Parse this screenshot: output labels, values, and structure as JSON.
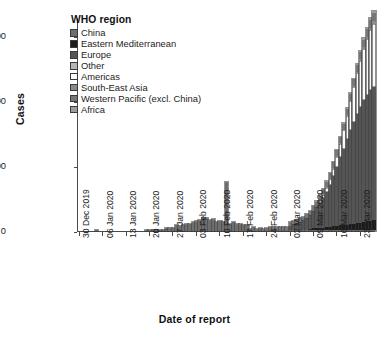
{
  "chart_data": {
    "type": "bar",
    "stacked": true,
    "title": "",
    "xlabel": "Date of report",
    "ylabel": "Cases",
    "ylim": [
      0,
      66000
    ],
    "yticks": [
      0,
      20000,
      40000,
      60000
    ],
    "ytick_labels": [
      "0",
      "20000",
      "40000",
      "60000"
    ],
    "grid": false,
    "legend_title": "WHO region",
    "legend_position": "top-left-inside",
    "xtick_labels": [
      "30 Dec 2019",
      "06 Jan 2020",
      "13 Jan 2020",
      "20 Jan 2020",
      "27 Jan 2020",
      "03 Feb 2020",
      "10 Feb 2020",
      "17 Feb 2020",
      "24 Feb 2020",
      "02 Mar 2020",
      "09 Mar 2020",
      "16 Mar 2020",
      "23 Mar 2020"
    ],
    "xtick_indices": [
      0,
      7,
      14,
      21,
      28,
      35,
      42,
      49,
      56,
      63,
      70,
      77,
      84
    ],
    "series": [
      {
        "name": "China",
        "color": "#6e6e6e"
      },
      {
        "name": "Eastern Mediterranean",
        "color": "#1c1c1c"
      },
      {
        "name": "Europe",
        "color": "#555555"
      },
      {
        "name": "Other",
        "color": "#b5b5b5"
      },
      {
        "name": "Americas",
        "color": "#fbfbfb"
      },
      {
        "name": "South-East Asia",
        "color": "#8a8a8a"
      },
      {
        "name": "Western Pacific (excl. China)",
        "color": "#777777"
      },
      {
        "name": "Africa",
        "color": "#9d9d9d"
      }
    ],
    "x": [
      "2019-12-30",
      "2019-12-31",
      "2020-01-01",
      "2020-01-02",
      "2020-01-03",
      "2020-01-04",
      "2020-01-05",
      "2020-01-06",
      "2020-01-07",
      "2020-01-08",
      "2020-01-09",
      "2020-01-10",
      "2020-01-11",
      "2020-01-12",
      "2020-01-13",
      "2020-01-14",
      "2020-01-15",
      "2020-01-16",
      "2020-01-17",
      "2020-01-18",
      "2020-01-19",
      "2020-01-20",
      "2020-01-21",
      "2020-01-22",
      "2020-01-23",
      "2020-01-24",
      "2020-01-25",
      "2020-01-26",
      "2020-01-27",
      "2020-01-28",
      "2020-01-29",
      "2020-01-30",
      "2020-01-31",
      "2020-02-01",
      "2020-02-02",
      "2020-02-03",
      "2020-02-04",
      "2020-02-05",
      "2020-02-06",
      "2020-02-07",
      "2020-02-08",
      "2020-02-09",
      "2020-02-10",
      "2020-02-11",
      "2020-02-12",
      "2020-02-13",
      "2020-02-14",
      "2020-02-15",
      "2020-02-16",
      "2020-02-17",
      "2020-02-18",
      "2020-02-19",
      "2020-02-20",
      "2020-02-21",
      "2020-02-22",
      "2020-02-23",
      "2020-02-24",
      "2020-02-25",
      "2020-02-26",
      "2020-02-27",
      "2020-02-28",
      "2020-02-29",
      "2020-03-01",
      "2020-03-02",
      "2020-03-03",
      "2020-03-04",
      "2020-03-05",
      "2020-03-06",
      "2020-03-07",
      "2020-03-08",
      "2020-03-09",
      "2020-03-10",
      "2020-03-11",
      "2020-03-12",
      "2020-03-13",
      "2020-03-14",
      "2020-03-15",
      "2020-03-16",
      "2020-03-17",
      "2020-03-18",
      "2020-03-19",
      "2020-03-20",
      "2020-03-21",
      "2020-03-22",
      "2020-03-23",
      "2020-03-24",
      "2020-03-25",
      "2020-03-26",
      "2020-03-27"
    ],
    "values": {
      "China": [
        0,
        0,
        0,
        0,
        0,
        44,
        0,
        0,
        0,
        0,
        0,
        0,
        0,
        0,
        0,
        0,
        0,
        0,
        0,
        0,
        136,
        51,
        151,
        140,
        97,
        259,
        444,
        688,
        769,
        1771,
        1459,
        1737,
        1982,
        2102,
        2590,
        2829,
        3235,
        3893,
        3697,
        3151,
        3387,
        2653,
        2984,
        2473,
        14840,
        2015,
        2641,
        1843,
        1933,
        1807,
        1741,
        394,
        889,
        397,
        648,
        228,
        409,
        508,
        406,
        433,
        327,
        427,
        206,
        202,
        129,
        130,
        146,
        143,
        99,
        44,
        40,
        19,
        24,
        15,
        11,
        20,
        16,
        21,
        13,
        11,
        8,
        34,
        46,
        45,
        39,
        78,
        47,
        54,
        55,
        45
      ],
      "Eastern Mediterranean": [
        0,
        0,
        0,
        0,
        0,
        0,
        0,
        0,
        0,
        0,
        0,
        0,
        0,
        0,
        0,
        0,
        0,
        0,
        0,
        0,
        0,
        0,
        0,
        0,
        0,
        0,
        0,
        0,
        0,
        0,
        0,
        0,
        0,
        0,
        0,
        0,
        0,
        0,
        0,
        0,
        0,
        0,
        0,
        0,
        0,
        0,
        0,
        0,
        0,
        0,
        0,
        0,
        0,
        0,
        0,
        0,
        0,
        0,
        0,
        0,
        0,
        0,
        0,
        205,
        145,
        165,
        170,
        205,
        235,
        425,
        595,
        640,
        755,
        810,
        905,
        1060,
        1245,
        1400,
        1600,
        1750,
        1820,
        1905,
        2080,
        2220,
        2350,
        2580,
        2790,
        2980,
        3210,
        3420
      ],
      "Europe": [
        0,
        0,
        0,
        0,
        0,
        0,
        0,
        0,
        0,
        0,
        0,
        0,
        0,
        0,
        0,
        0,
        0,
        0,
        0,
        0,
        0,
        0,
        0,
        0,
        0,
        0,
        1,
        0,
        0,
        0,
        0,
        0,
        0,
        0,
        0,
        0,
        0,
        0,
        0,
        0,
        0,
        0,
        0,
        0,
        0,
        0,
        0,
        0,
        0,
        0,
        0,
        0,
        0,
        0,
        0,
        0,
        0,
        0,
        0,
        0,
        0,
        0,
        0,
        1100,
        1480,
        1850,
        2170,
        2700,
        3350,
        4080,
        5100,
        6250,
        7600,
        9200,
        11000,
        13000,
        15500,
        18200,
        20900,
        23500,
        26300,
        29000,
        31500,
        33800,
        35800,
        37600,
        39000,
        40200,
        41000,
        41800
      ],
      "Other": [
        0,
        0,
        0,
        0,
        0,
        0,
        0,
        0,
        0,
        0,
        0,
        0,
        0,
        0,
        0,
        0,
        0,
        0,
        0,
        0,
        0,
        0,
        0,
        0,
        0,
        0,
        0,
        0,
        0,
        0,
        0,
        0,
        0,
        0,
        0,
        0,
        0,
        0,
        0,
        0,
        0,
        0,
        0,
        0,
        0,
        0,
        0,
        0,
        0,
        0,
        0,
        0,
        0,
        0,
        0,
        0,
        0,
        0,
        0,
        0,
        0,
        0,
        0,
        0,
        0,
        0,
        0,
        0,
        0,
        0,
        0,
        0,
        0,
        0,
        0,
        0,
        0,
        0,
        0,
        0,
        0,
        0,
        0,
        0,
        0,
        0,
        0,
        0,
        0
      ],
      "Americas": [
        0,
        0,
        0,
        0,
        0,
        0,
        0,
        0,
        0,
        0,
        0,
        0,
        0,
        0,
        0,
        0,
        0,
        0,
        0,
        0,
        0,
        0,
        0,
        0,
        0,
        0,
        0,
        0,
        0,
        0,
        0,
        0,
        0,
        0,
        0,
        0,
        0,
        0,
        0,
        0,
        0,
        0,
        0,
        0,
        0,
        0,
        0,
        0,
        0,
        0,
        0,
        0,
        0,
        0,
        0,
        0,
        0,
        0,
        0,
        0,
        0,
        0,
        0,
        60,
        70,
        80,
        95,
        120,
        160,
        240,
        330,
        470,
        640,
        900,
        1250,
        1700,
        2300,
        3100,
        4200,
        5600,
        7200,
        8900,
        10600,
        12400,
        14200,
        15900,
        17300,
        18600,
        19500,
        20200
      ],
      "South-East Asia": [
        0,
        0,
        0,
        0,
        0,
        0,
        0,
        0,
        0,
        0,
        0,
        0,
        0,
        0,
        0,
        0,
        0,
        0,
        0,
        0,
        0,
        0,
        0,
        0,
        0,
        0,
        0,
        0,
        0,
        0,
        0,
        0,
        0,
        0,
        0,
        0,
        0,
        0,
        0,
        0,
        0,
        0,
        0,
        0,
        0,
        0,
        0,
        0,
        0,
        0,
        0,
        0,
        0,
        0,
        0,
        0,
        0,
        0,
        0,
        0,
        0,
        0,
        0,
        0,
        0,
        0,
        0,
        0,
        0,
        0,
        0,
        0,
        30,
        40,
        55,
        70,
        85,
        105,
        130,
        160,
        200,
        240,
        290,
        350,
        420,
        500,
        590,
        680,
        790
      ],
      "Western Pacific (excl. China)": [
        0,
        0,
        0,
        0,
        0,
        0,
        0,
        0,
        0,
        0,
        0,
        0,
        0,
        0,
        0,
        0,
        0,
        0,
        0,
        0,
        0,
        1,
        2,
        3,
        4,
        6,
        8,
        12,
        16,
        20,
        24,
        30,
        36,
        42,
        48,
        55,
        62,
        70,
        80,
        90,
        100,
        110,
        120,
        130,
        140,
        150,
        160,
        175,
        190,
        205,
        225,
        250,
        280,
        320,
        380,
        450,
        530,
        620,
        700,
        780,
        840,
        900,
        950,
        1000,
        1050,
        1100,
        1150,
        1200,
        1260,
        1320,
        1380,
        1440,
        1500,
        1560,
        1620,
        1680,
        1740,
        1800,
        1860,
        1920,
        1980,
        2040,
        2100,
        2160,
        2220,
        2280,
        2340,
        2400,
        2460
      ],
      "Africa": [
        0,
        0,
        0,
        0,
        0,
        0,
        0,
        0,
        0,
        0,
        0,
        0,
        0,
        0,
        0,
        0,
        0,
        0,
        0,
        0,
        0,
        0,
        0,
        0,
        0,
        0,
        0,
        0,
        0,
        0,
        0,
        0,
        0,
        0,
        0,
        0,
        0,
        0,
        0,
        0,
        0,
        0,
        0,
        0,
        0,
        0,
        0,
        0,
        0,
        0,
        0,
        0,
        0,
        0,
        0,
        0,
        0,
        0,
        0,
        0,
        0,
        0,
        0,
        0,
        0,
        0,
        0,
        0,
        0,
        0,
        10,
        15,
        20,
        28,
        38,
        50,
        65,
        85,
        110,
        140,
        175,
        215,
        260,
        315,
        380,
        450,
        530,
        620,
        720
      ]
    }
  },
  "legend": {
    "title": "WHO region",
    "items": [
      {
        "label": "China",
        "color": "#6e6e6e"
      },
      {
        "label": "Eastern Mediterranean",
        "color": "#1c1c1c"
      },
      {
        "label": "Europe",
        "color": "#555555"
      },
      {
        "label": "Other",
        "color": "#b5b5b5"
      },
      {
        "label": "Americas",
        "color": "#fbfbfb"
      },
      {
        "label": "South-East Asia",
        "color": "#8a8a8a"
      },
      {
        "label": "Western Pacific (excl. China)",
        "color": "#777777"
      },
      {
        "label": "Africa",
        "color": "#9d9d9d"
      }
    ]
  },
  "axes": {
    "ylabel": "Cases",
    "xlabel": "Date of report"
  }
}
